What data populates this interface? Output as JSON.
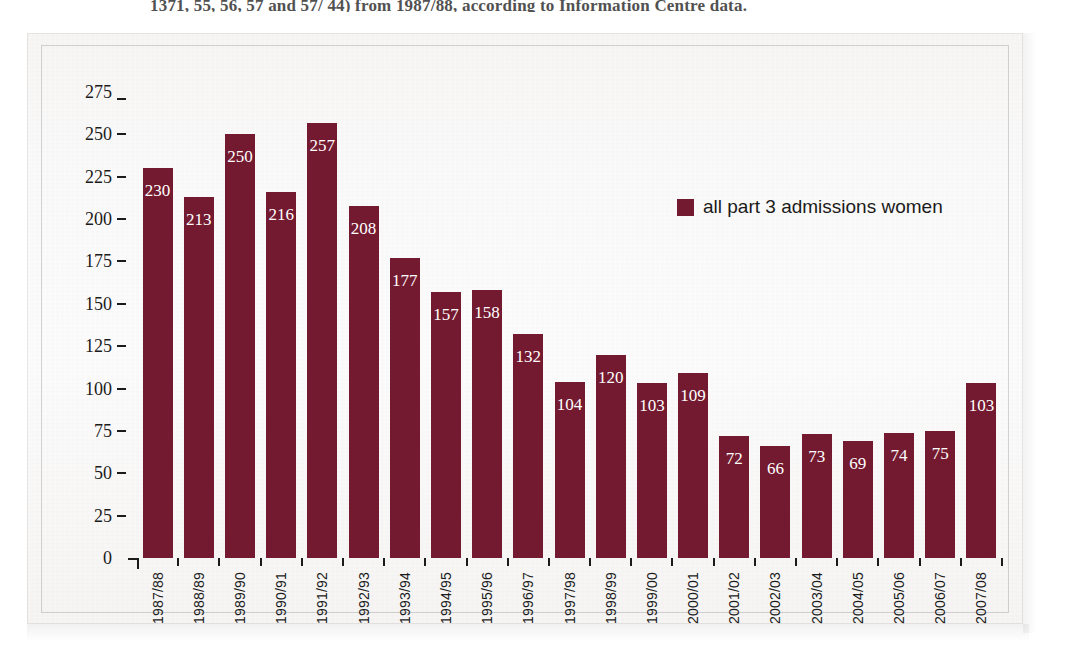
{
  "page": {
    "ghost_text": "1371, 55, 56, 57 and 57/ 44) from 1987/88, according to Information Centre data."
  },
  "chart_data": {
    "type": "bar",
    "title": "",
    "subtitle": "",
    "xlabel": "",
    "ylabel": "",
    "ylim": [
      0,
      275
    ],
    "grid": false,
    "legend_position": "top-right",
    "orientation": "vertical",
    "bar_color": "#741a30",
    "value_label_color": "#ffffff",
    "axis_color": "#1b1b1b",
    "background_color": "#faf9f8",
    "categories": [
      "1987/88",
      "1988/89",
      "1989/90",
      "1990/91",
      "1991/92",
      "1992/93",
      "1993/94",
      "1994/95",
      "1995/96",
      "1996/97",
      "1997/98",
      "1998/99",
      "1999/00",
      "2000/01",
      "2001/02",
      "2002/03",
      "2003/04",
      "2004/05",
      "2005/06",
      "2006/07",
      "2007/08"
    ],
    "values": [
      230,
      213,
      250,
      216,
      257,
      208,
      177,
      157,
      158,
      132,
      104,
      120,
      103,
      109,
      72,
      66,
      73,
      69,
      74,
      75,
      103
    ],
    "series": [
      {
        "name": "all part 3 admissions women",
        "color": "#741a30",
        "values": [
          230,
          213,
          250,
          216,
          257,
          208,
          177,
          157,
          158,
          132,
          104,
          120,
          103,
          109,
          72,
          66,
          73,
          69,
          74,
          75,
          103
        ]
      }
    ],
    "yticks": [
      0,
      25,
      50,
      75,
      100,
      125,
      150,
      175,
      200,
      225,
      250,
      275
    ],
    "ytick_labels": [
      "0",
      "25",
      "50",
      "75",
      "100",
      "125",
      "150",
      "175",
      "200",
      "225",
      "250",
      "275"
    ],
    "legend": [
      {
        "label": "all part 3 admissions women",
        "color": "#741a30"
      }
    ]
  }
}
